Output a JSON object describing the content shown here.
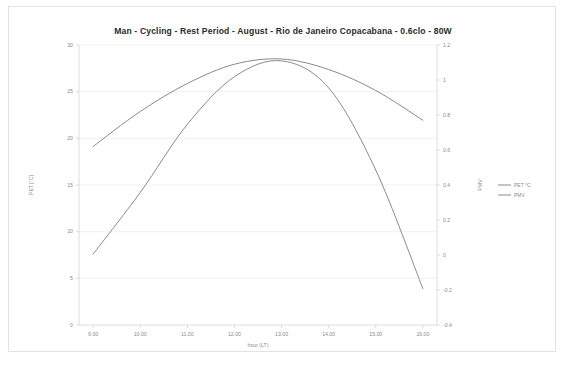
{
  "figure": {
    "background_color": "#ffffff",
    "frame_color": "#e2e2e2"
  },
  "chart_data": {
    "type": "line",
    "title": "Man - Cycling - Rest Period - August - Rio de Janeiro Copacabana - 0.6clo - 80W",
    "xlabel": "hour (LT)",
    "x": [
      9,
      10,
      11,
      12,
      13,
      14,
      15,
      16
    ],
    "xtick_labels": [
      "9.00",
      "10.00",
      "11.00",
      "12.00",
      "13.00",
      "14.00",
      "15.00",
      "16.00"
    ],
    "xlim": [
      8.7,
      16.3
    ],
    "grid": true,
    "legend_position": "right",
    "axes": [
      {
        "id": "left",
        "label": "PET [°C]",
        "ylim": [
          0,
          30
        ],
        "yticks": [
          0,
          5,
          10,
          15,
          20,
          25,
          30
        ],
        "ytick_labels": [
          "0",
          "5",
          "10",
          "15",
          "20",
          "25",
          "30"
        ]
      },
      {
        "id": "right",
        "label": "PMV",
        "ylim": [
          -0.4,
          1.2
        ],
        "yticks": [
          -0.4,
          -0.2,
          0,
          0.2,
          0.4,
          0.6,
          0.8,
          1,
          1.2
        ],
        "ytick_labels": [
          "-0.4",
          "-0.2",
          "0",
          "0.2",
          "0.4",
          "0.6",
          "0.8",
          "1",
          "1.2"
        ]
      }
    ],
    "series": [
      {
        "name": "PET °C",
        "axis": "left",
        "color": "#8a8a8a",
        "values": [
          7.6,
          14.2,
          21.5,
          26.6,
          28.3,
          25.4,
          16.6,
          3.9
        ]
      },
      {
        "name": "PMV",
        "axis": "right",
        "color": "#8a8a8a",
        "values": [
          0.62,
          0.82,
          0.98,
          1.09,
          1.12,
          1.06,
          0.94,
          0.77
        ]
      }
    ]
  },
  "legend": {
    "items": [
      {
        "label": "PET °C",
        "color": "#8a8a8a"
      },
      {
        "label": "PMV",
        "color": "#8a8a8a"
      }
    ]
  }
}
